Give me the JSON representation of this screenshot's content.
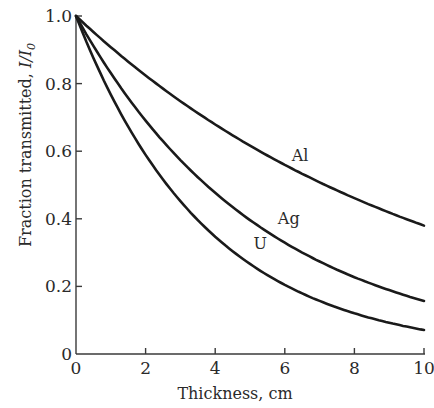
{
  "chart_data": {
    "type": "line",
    "title": "",
    "xlabel": "Thickness, cm",
    "ylabel": "Fraction transmitted, I/I₀",
    "xlim": [
      0,
      10
    ],
    "ylim": [
      0,
      1.0
    ],
    "grid": false,
    "legend": "none (inline curve labels)",
    "x_ticks": [
      0,
      2,
      4,
      6,
      8,
      10
    ],
    "x_tick_labels": [
      "0",
      "2",
      "4",
      "6",
      "8",
      "10"
    ],
    "y_ticks": [
      0,
      0.2,
      0.4,
      0.6,
      0.8,
      1.0
    ],
    "y_tick_labels": [
      "0",
      "0.2",
      "0.4",
      "0.6",
      "0.8",
      "1.0"
    ],
    "x": [
      0,
      1,
      2,
      3,
      4,
      5,
      6,
      7,
      8,
      9,
      10
    ],
    "series": [
      {
        "name": "Al",
        "values": [
          1.0,
          0.908,
          0.824,
          0.748,
          0.679,
          0.617,
          0.56,
          0.508,
          0.462,
          0.419,
          0.38
        ]
      },
      {
        "name": "Ag",
        "values": [
          1.0,
          0.831,
          0.69,
          0.574,
          0.476,
          0.396,
          0.329,
          0.273,
          0.227,
          0.189,
          0.157
        ]
      },
      {
        "name": "U",
        "values": [
          1.0,
          0.767,
          0.589,
          0.452,
          0.347,
          0.266,
          0.204,
          0.157,
          0.12,
          0.092,
          0.071
        ]
      }
    ],
    "annotations": [
      {
        "text": "Al",
        "x": 6.2,
        "y": 0.57
      },
      {
        "text": "Ag",
        "x": 5.8,
        "y": 0.385
      },
      {
        "text": "U",
        "x": 5.1,
        "y": 0.31
      }
    ]
  },
  "labels": {
    "xlabel": "Thickness, cm",
    "ylabel_prefix": "Fraction transmitted, ",
    "ylabel_italic": "I/I",
    "ylabel_sub": "0"
  }
}
